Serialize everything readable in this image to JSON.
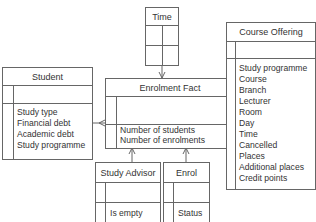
{
  "diagram": {
    "type": "star-schema",
    "entities": {
      "time": {
        "title": "Time",
        "attributes": []
      },
      "enrolment_fact": {
        "title": "Enrolment Fact",
        "attributes": [
          "Number of students",
          "Number of enrolments"
        ]
      },
      "student": {
        "title": "Student",
        "attributes": [
          "Study type",
          "Financial debt",
          "Academic debt",
          "Study programme"
        ]
      },
      "course_offering": {
        "title": "Course Offering",
        "attributes": [
          "Study programme",
          "Course",
          "Branch",
          "Lecturer",
          "Room",
          "Day",
          "Time",
          "Cancelled",
          "Places",
          "Additional places",
          "Credit points"
        ]
      },
      "study_advisor": {
        "title": "Study Advisor",
        "attributes": [
          "Is empty"
        ]
      },
      "enrol": {
        "title": "Enrol",
        "attributes": [
          "Status"
        ]
      }
    },
    "relationships": [
      {
        "from": "Time",
        "to": "Enrolment Fact",
        "cardinality": "one-to-many"
      },
      {
        "from": "Student",
        "to": "Enrolment Fact",
        "cardinality": "one-to-many"
      },
      {
        "from": "Course Offering",
        "to": "Enrolment Fact",
        "cardinality": "one-to-many"
      },
      {
        "from": "Study Advisor",
        "to": "Enrolment Fact",
        "cardinality": "one-to-many"
      },
      {
        "from": "Enrol",
        "to": "Enrolment Fact",
        "cardinality": "one-to-many"
      }
    ],
    "colors": {
      "line": "#666666",
      "text": "#333333",
      "background": "#ffffff"
    }
  }
}
